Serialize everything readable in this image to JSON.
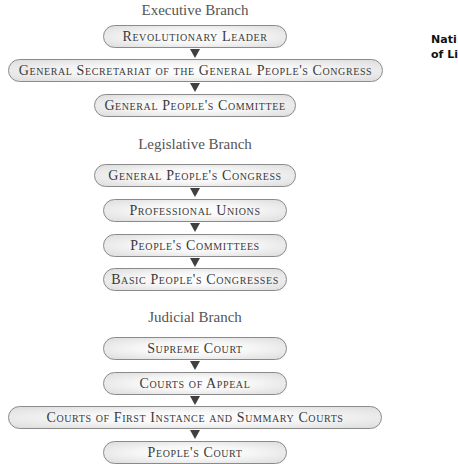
{
  "side_label": {
    "line1": "Nati",
    "line2": "of Li"
  },
  "branches": [
    {
      "heading": "Executive Branch",
      "nodes": [
        "Revolutionary Leader",
        "General Secretariat of the General People's Congress",
        "General People's Committee"
      ]
    },
    {
      "heading": "Legislative Branch",
      "nodes": [
        "General People's Congress",
        "Professional Unions",
        "People's Committees",
        "Basic People's Congresses"
      ]
    },
    {
      "heading": "Judicial Branch",
      "nodes": [
        "Supreme Court",
        "Courts of Appeal",
        "Courts of First Instance and Summary Courts",
        "People's Court"
      ]
    }
  ],
  "colors": {
    "arrow": "#404040",
    "box_border": "#8a8a8a",
    "text": "#3a3a3a",
    "heading": "#555555"
  }
}
